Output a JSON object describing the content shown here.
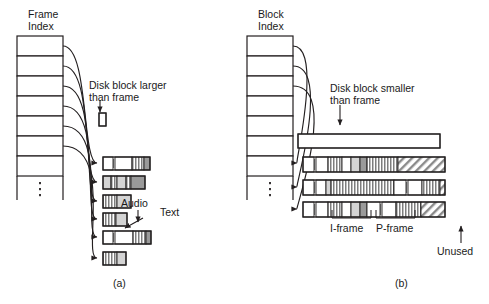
{
  "figure": {
    "panels": [
      {
        "id": "a",
        "caption": "(a)",
        "index_table": {
          "title_line1": "Frame",
          "title_line2": "Index",
          "rows": 7,
          "ellipsis": "⋮"
        },
        "callout": {
          "line1": "Disk block larger",
          "line2": "than frame"
        },
        "annotations": [
          {
            "name": "audio",
            "label": "Audio"
          },
          {
            "name": "text",
            "label": "Text"
          }
        ],
        "blocks": [
          {
            "name": "sample-disk-block",
            "width": 7,
            "segments": [
              {
                "fill": "white",
                "w": 7
              }
            ]
          },
          {
            "name": "disk-block-1",
            "width": 47,
            "segments": [
              {
                "fill": "white",
                "w": 10
              },
              {
                "fill": "tick",
                "w": 2
              },
              {
                "fill": "white",
                "w": 17
              },
              {
                "fill": "stripe",
                "w": 12
              },
              {
                "fill": "gray",
                "w": 6
              }
            ]
          },
          {
            "name": "disk-block-2",
            "width": 42,
            "segments": [
              {
                "fill": "litegray",
                "w": 8
              },
              {
                "fill": "stripe",
                "w": 6
              },
              {
                "fill": "litegray",
                "w": 9
              },
              {
                "fill": "stripe",
                "w": 5
              },
              {
                "fill": "gray",
                "w": 14
              }
            ]
          },
          {
            "name": "disk-block-3",
            "width": 28,
            "segments": [
              {
                "fill": "stripe",
                "w": 14
              },
              {
                "fill": "litegray",
                "w": 14
              }
            ]
          },
          {
            "name": "disk-block-4",
            "width": 24,
            "segments": [
              {
                "fill": "stripe",
                "w": 13
              },
              {
                "fill": "litegray",
                "w": 11
              }
            ]
          },
          {
            "name": "disk-block-5",
            "width": 48,
            "segments": [
              {
                "fill": "white",
                "w": 10
              },
              {
                "fill": "tick",
                "w": 2
              },
              {
                "fill": "white",
                "w": 18
              },
              {
                "fill": "stripe",
                "w": 13
              },
              {
                "fill": "gray",
                "w": 5
              }
            ]
          },
          {
            "name": "disk-block-6",
            "width": 23,
            "segments": [
              {
                "fill": "stripe",
                "w": 14
              },
              {
                "fill": "litegray",
                "w": 9
              }
            ]
          }
        ]
      },
      {
        "id": "b",
        "caption": "(b)",
        "index_table": {
          "title_line1": "Block",
          "title_line2": "Index",
          "rows": 7,
          "ellipsis": "⋮"
        },
        "callout": {
          "line1": "Disk block smaller",
          "line2": "than frame"
        },
        "annotations": [
          {
            "name": "i-frame",
            "label": "I-frame"
          },
          {
            "name": "p-frame",
            "label": "P-frame"
          },
          {
            "name": "unused",
            "label": "Unused"
          }
        ],
        "blocks": [
          {
            "name": "disk-block-empty",
            "width": 142,
            "segments": [
              {
                "fill": "white",
                "w": 142
              }
            ]
          },
          {
            "name": "disk-block-1",
            "width": 142,
            "segments": [
              {
                "fill": "white",
                "w": 11
              },
              {
                "fill": "tick",
                "w": 2
              },
              {
                "fill": "white",
                "w": 12
              },
              {
                "fill": "stripe",
                "w": 14
              },
              {
                "fill": "white",
                "w": 9
              },
              {
                "fill": "litegray",
                "w": 9
              },
              {
                "fill": "gray",
                "w": 7
              },
              {
                "fill": "stripe",
                "w": 31
              },
              {
                "fill": "hatch",
                "w": 47
              }
            ]
          },
          {
            "name": "disk-block-2",
            "width": 142,
            "segments": [
              {
                "fill": "white",
                "w": 11
              },
              {
                "fill": "tick",
                "w": 2
              },
              {
                "fill": "white",
                "w": 10
              },
              {
                "fill": "litegray",
                "w": 5
              },
              {
                "fill": "stripe",
                "w": 63
              },
              {
                "fill": "white",
                "w": 12
              },
              {
                "fill": "tick",
                "w": 2
              },
              {
                "fill": "white",
                "w": 14
              },
              {
                "fill": "stripe",
                "w": 18
              },
              {
                "fill": "hatch",
                "w": 5
              }
            ]
          },
          {
            "name": "disk-block-3",
            "width": 142,
            "segments": [
              {
                "fill": "white",
                "w": 11
              },
              {
                "fill": "tick",
                "w": 2
              },
              {
                "fill": "white",
                "w": 12
              },
              {
                "fill": "stripe",
                "w": 14
              },
              {
                "fill": "white",
                "w": 9
              },
              {
                "fill": "litegray",
                "w": 9
              },
              {
                "fill": "gray",
                "w": 7
              },
              {
                "fill": "white",
                "w": 13
              },
              {
                "fill": "tick",
                "w": 2
              },
              {
                "fill": "white",
                "w": 14
              },
              {
                "fill": "stripe",
                "w": 25
              },
              {
                "fill": "hatch",
                "w": 24
              }
            ]
          }
        ]
      }
    ]
  },
  "colors": {
    "stroke": "#231f20",
    "gray": "#9a9a9a",
    "litegray": "#d4d4d4",
    "white": "#ffffff"
  }
}
